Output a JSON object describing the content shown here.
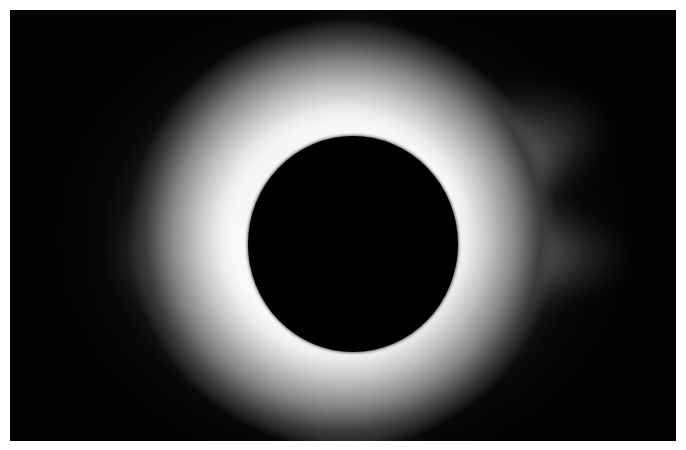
{
  "image": {
    "subject": "total solar eclipse",
    "description": "Black-and-white photograph of a total solar eclipse: dark lunar disk surrounded by a bright white solar corona with streamers fading into a black sky",
    "colors": {
      "sky": "#020202",
      "moon": "#000000",
      "corona": "#ffffff",
      "border": "#ffffff"
    }
  }
}
